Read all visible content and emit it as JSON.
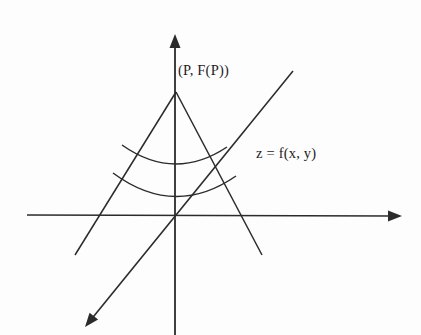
{
  "figure": {
    "background_color": "#fdfdfd",
    "stroke_color": "#2b2b2b",
    "labels": {
      "apex_point": "(P, F(P))",
      "surface_equation": "z = f(x, y)"
    }
  },
  "chart_data": {
    "type": "line",
    "xlabel": "",
    "ylabel": "",
    "grid": false,
    "legend_position": "none",
    "axes": [
      {
        "name": "horizontal-axis",
        "from": [
          27,
          215
        ],
        "to": [
          402,
          216
        ],
        "arrow_at": "end"
      },
      {
        "name": "vertical-axis",
        "from": [
          175,
          34
        ],
        "to": [
          175,
          335
        ],
        "arrow_at": "start"
      },
      {
        "name": "depth-axis",
        "from": [
          293,
          71
        ],
        "to": [
          85,
          327
        ],
        "arrow_at": "end"
      }
    ],
    "cone": {
      "apex": [
        176,
        92
      ],
      "left_edge_end": [
        75,
        255
      ],
      "right_edge_end": [
        262,
        255
      ],
      "arcs": [
        {
          "name": "upper-arc",
          "left_end": [
            122,
            145
          ],
          "right_end": [
            227,
            147
          ],
          "sag": 18
        },
        {
          "name": "lower-arc",
          "left_end": [
            113,
            173
          ],
          "right_end": [
            236,
            176
          ],
          "sag": 22
        }
      ]
    },
    "annotations": [
      {
        "text": "(P, F(P))",
        "x": 178,
        "y": 63
      },
      {
        "text": "z = f(x, y)",
        "x": 256,
        "y": 146
      }
    ]
  }
}
